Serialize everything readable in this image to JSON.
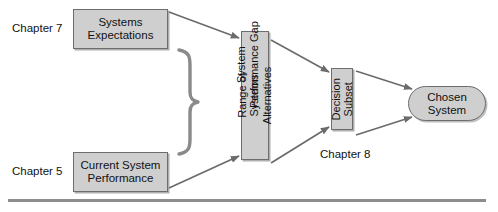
{
  "diagram": {
    "colors": {
      "node_fill": "#cfcfcf",
      "node_border": "#6d6d6d",
      "arrow": "#6b6b6b",
      "rule": "#8d8d8d",
      "text": "#111111"
    },
    "nodes": [
      {
        "id": "systems-expectations",
        "label": "Systems\nExpectations",
        "shape": "rectangle"
      },
      {
        "id": "current-system-performance",
        "label": "Current System\nPerformance",
        "shape": "rectangle"
      },
      {
        "id": "range-alternatives",
        "label": "Range of Systems\nAlternatives",
        "shape": "rectangle-vertical"
      },
      {
        "id": "decision-subset",
        "label": "Decision\nSubset",
        "shape": "rectangle-vertical"
      },
      {
        "id": "chosen-system",
        "label": "Chosen\nSystem",
        "shape": "rounded-rectangle"
      }
    ],
    "labels": {
      "chapter_7": "Chapter 7",
      "chapter_5": "Chapter 5",
      "chapter_8": "Chapter 8",
      "system_performance_gap": "System\nPerformance Gap"
    },
    "connectors": [
      {
        "id": "expectations-to-range",
        "from": "systems-expectations",
        "to": "range-alternatives",
        "style": "arrow"
      },
      {
        "id": "performance-to-range",
        "from": "current-system-performance",
        "to": "range-alternatives",
        "style": "arrow"
      },
      {
        "id": "range-to-decision-upper",
        "from": "range-alternatives",
        "to": "decision-subset",
        "style": "arrow"
      },
      {
        "id": "range-to-decision-lower",
        "from": "range-alternatives",
        "to": "decision-subset",
        "style": "arrow"
      },
      {
        "id": "decision-to-chosen-upper",
        "from": "decision-subset",
        "to": "chosen-system",
        "style": "arrow"
      },
      {
        "id": "decision-to-chosen-lower",
        "from": "decision-subset",
        "to": "chosen-system",
        "style": "arrow"
      },
      {
        "id": "gap-brace",
        "from": "systems-expectations",
        "to": "current-system-performance",
        "style": "curly-brace"
      }
    ]
  }
}
